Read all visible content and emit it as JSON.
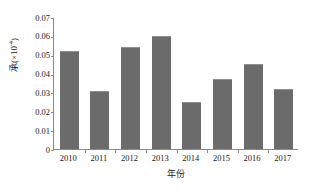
{
  "chart_data": {
    "type": "bar",
    "title": "",
    "xlabel": "年份",
    "ylabel": "承(×10⁻⁴)",
    "ylabel_base": "承(×10",
    "ylabel_exp": "-4",
    "ylabel_close": ")",
    "categories": [
      "2010",
      "2011",
      "2012",
      "2013",
      "2014",
      "2015",
      "2016",
      "2017"
    ],
    "values": [
      0.052,
      0.031,
      0.054,
      0.06,
      0.025,
      0.037,
      0.045,
      0.032
    ],
    "ylim": [
      0,
      0.07
    ],
    "yticks": [
      0,
      0.01,
      0.02,
      0.03,
      0.04,
      0.05,
      0.06,
      0.07
    ],
    "ytick_labels": [
      "0",
      "0.01",
      "0.02",
      "0.03",
      "0.04",
      "0.05",
      "0.06",
      "0.07"
    ],
    "grid": false,
    "legend": "none",
    "bar_color": "#6b6b6b",
    "axis_color": "#8a8a8a"
  }
}
